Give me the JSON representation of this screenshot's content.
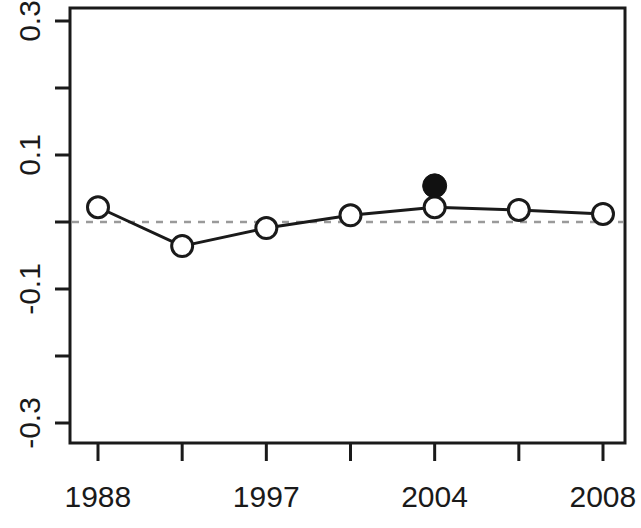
{
  "chart_data": {
    "type": "line",
    "title": "",
    "subtitle": "",
    "xlabel": "",
    "ylabel": "",
    "xlim": [
      1988,
      2008
    ],
    "ylim": [
      -0.32,
      0.32
    ],
    "grid": false,
    "legend": null,
    "x_tick_values": [
      1988,
      1991.5,
      1997,
      2000,
      2004,
      2006,
      2008
    ],
    "x_tick_labels": [
      "1988",
      "",
      "1997",
      "",
      "2004",
      "",
      "2008"
    ],
    "y_tick_values": [
      0.3,
      0.2,
      0.1,
      0.0,
      -0.1,
      -0.2,
      -0.3
    ],
    "y_tick_labels": [
      "0.3",
      "",
      "0.1",
      "",
      "-0.1",
      "",
      "-0.3"
    ],
    "reference_line": {
      "y": 0.0,
      "style": "dashed",
      "color": "#9a9a9a"
    },
    "series": [
      {
        "name": "estimate",
        "marker": "circle-open",
        "color": "#1a1a1a",
        "x": [
          1988,
          1991.5,
          1997,
          2000,
          2004,
          2006,
          2008
        ],
        "values": [
          0.022,
          -0.036,
          -0.009,
          0.01,
          0.022,
          0.018,
          0.012
        ],
        "filled": [
          false,
          false,
          false,
          false,
          false,
          false,
          false
        ]
      },
      {
        "name": "highlighted-point",
        "marker": "circle-filled",
        "color": "#111111",
        "x": [
          2004
        ],
        "values": [
          0.054
        ],
        "filled": [
          true
        ]
      }
    ]
  },
  "axes": {
    "y_labels": [
      {
        "text": "0.3",
        "value": 0.3
      },
      {
        "text": "0.1",
        "value": 0.1
      },
      {
        "text": "-0.1",
        "value": -0.1
      },
      {
        "text": "-0.3",
        "value": -0.3
      }
    ],
    "x_labels": [
      {
        "text": "1988",
        "value": 1988
      },
      {
        "text": "1997",
        "value": 1997
      },
      {
        "text": "2004",
        "value": 2004
      },
      {
        "text": "2008",
        "value": 2008
      }
    ]
  },
  "colors": {
    "axis": "#1a1a1a",
    "line": "#1a1a1a",
    "marker_edge": "#1a1a1a",
    "marker_fill_open": "#ffffff",
    "marker_fill_solid": "#111111",
    "reference": "#9a9a9a",
    "background": "#ffffff"
  }
}
